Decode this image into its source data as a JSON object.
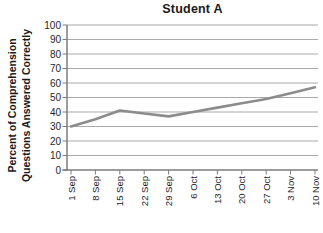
{
  "chart_data": {
    "type": "line",
    "title": "Student A",
    "ylabel_lines": [
      "Percent of Comprehension",
      "Questions Answered Correctly"
    ],
    "categories": [
      "1 Sep",
      "8 Sep",
      "15 Sep",
      "22 Sep",
      "29 Sep",
      "6 Oct",
      "13 Oct",
      "20 Oct",
      "27 Oct",
      "3 Nov",
      "10 Nov"
    ],
    "values": [
      30,
      35,
      41,
      39,
      37,
      40,
      43,
      46,
      49,
      53,
      57
    ],
    "yticks": [
      0,
      10,
      20,
      30,
      40,
      50,
      60,
      70,
      80,
      90,
      100
    ],
    "ylim": [
      0,
      100
    ],
    "grid": "horizontal",
    "legend": "none",
    "colors": {
      "line": "#8c8c8c",
      "grid": "#a9a9a9",
      "axis": "#7d7d7d",
      "tick_text": "#262626",
      "title_text": "#1a1a1a",
      "background": "#ffffff"
    }
  }
}
